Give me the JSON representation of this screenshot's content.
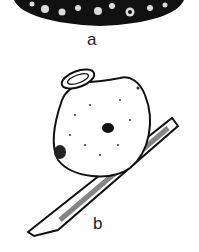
{
  "figure": {
    "panels": [
      {
        "label": "a",
        "description": "dark textured oval surface (cropped top)"
      },
      {
        "label": "b",
        "description": "round gall-like body with ringed neck on a diagonal twig"
      }
    ]
  },
  "colors": {
    "ink": "#111111",
    "paper": "#ffffff"
  }
}
